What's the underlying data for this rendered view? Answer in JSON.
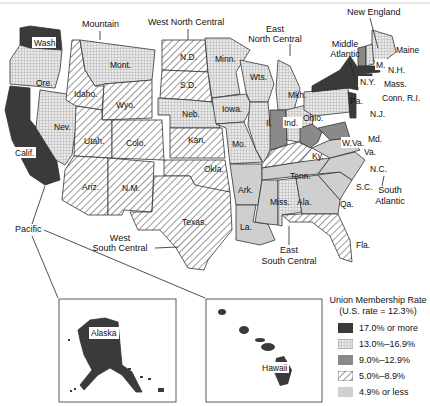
{
  "legend": {
    "title": "Union Membership Rate",
    "subtitle": "(U.S. rate = 12.3%)",
    "items": [
      {
        "label": "17.0% or more",
        "class": "c1"
      },
      {
        "label": "13.0%–16.9%",
        "class": "c2"
      },
      {
        "label": "9.0%–12.9%",
        "class": "c3"
      },
      {
        "label": "5.0%–8.9%",
        "class": "c4"
      },
      {
        "label": "4.9% or less",
        "class": "c5"
      }
    ]
  },
  "colors": {
    "c1": "#3a3a3a",
    "c2_bg": "#e6e6e6",
    "c3": "#8a8a8a",
    "c4_bg": "#ffffff",
    "c5": "#cfcfcf"
  },
  "regions": {
    "pacific": "Pacific",
    "mountain": "Mountain",
    "west_north_central": "West North Central",
    "east_north_central_1": "East",
    "east_north_central_2": "North Central",
    "new_england": "New England",
    "middle_atlantic_1": "Middle",
    "middle_atlantic_2": "Atlantic",
    "south_atlantic_1": "South",
    "south_atlantic_2": "Atlantic",
    "west_south_central_1": "West",
    "west_south_central_2": "South Central",
    "east_south_central_1": "East",
    "east_south_central_2": "South Central"
  },
  "states": {
    "wash": "Wash.",
    "ore": "Ore.",
    "calif": "Calif.",
    "nev": "Nev.",
    "idaho": "Idaho.",
    "mont": "Mont.",
    "wyo": "Wyo.",
    "utah": "Utah.",
    "colo": "Colo.",
    "ariz": "Ariz.",
    "nm": "N.M.",
    "nd": "N.D.",
    "sd": "S.D.",
    "neb": "Neb.",
    "kan": "Kan.",
    "okla": "Okla.",
    "texas": "Texas.",
    "minn": "Minn.",
    "iowa": "Iowa.",
    "mo": "Mo.",
    "ark": "Ark.",
    "la": "La.",
    "wis": "Wts.",
    "mich": "Mkh.",
    "ill": "Il.",
    "ind": "Ind.",
    "ohio": "Ohio.",
    "ky": "Ky.",
    "tenn": "Tenn.",
    "miss": "Miss.",
    "ala": "Ala.",
    "ga": "Qa.",
    "fla": "Fla.",
    "sc": "S.C.",
    "nc": "N.C.",
    "va": "Va.",
    "wva": "W.Va.",
    "md": "Md.",
    "pa": "Pa.",
    "ny": "N.Y.",
    "nj": "N.J.",
    "maine": "Maine",
    "vt": "M.",
    "nh": "N.H.",
    "mass": "Mass.",
    "conn_ri": "Conn. R.I.",
    "alaska": "Alaska",
    "hawaii": "Hawaii"
  }
}
